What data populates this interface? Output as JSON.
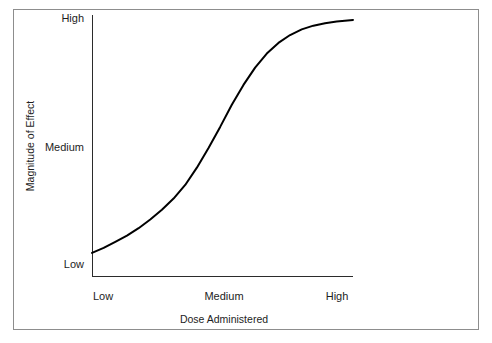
{
  "chart_data": {
    "type": "line",
    "title": "",
    "subtitle": "",
    "xlabel": "Dose Administered",
    "ylabel": "Magnitude of Effect",
    "x_tick_labels": [
      "Low",
      "Medium",
      "High"
    ],
    "y_tick_labels": [
      "Low",
      "Medium",
      "High"
    ],
    "x_tick_positions": [
      0,
      0.5,
      1
    ],
    "y_tick_positions": [
      0,
      0.5,
      1
    ],
    "xlim": [
      0,
      1.12
    ],
    "ylim": [
      0,
      1
    ],
    "grid": false,
    "legend": null,
    "annotations": [],
    "series": [
      {
        "name": "Dose-response",
        "description": "Sigmoid (S-shaped) dose-response curve rising from Low effect at Low dose to High effect at High dose, with steepest slope near the Medium dose.",
        "line_color": "#000000",
        "line_width": 2,
        "x": [
          0.0,
          0.05,
          0.1,
          0.15,
          0.2,
          0.25,
          0.3,
          0.35,
          0.4,
          0.45,
          0.5,
          0.55,
          0.6,
          0.65,
          0.7,
          0.75,
          0.8,
          0.85,
          0.9,
          0.95,
          1.0,
          1.05,
          1.12
        ],
        "y": [
          0.045,
          0.065,
          0.09,
          0.115,
          0.145,
          0.18,
          0.22,
          0.265,
          0.32,
          0.39,
          0.47,
          0.555,
          0.645,
          0.725,
          0.795,
          0.852,
          0.895,
          0.927,
          0.95,
          0.965,
          0.975,
          0.982,
          0.988
        ]
      }
    ]
  },
  "axes": {
    "y_ticks": {
      "high": "High",
      "medium": "Medium",
      "low": "Low"
    },
    "x_ticks": {
      "low": "Low",
      "medium": "Medium",
      "high": "High"
    },
    "x_axis_title": "Dose Administered",
    "y_axis_title": "Magnitude of Effect"
  },
  "style": {
    "background": "#ffffff",
    "frame_border": "#8d8d8d",
    "axis_color": "#2b2b2b",
    "curve_color": "#000000",
    "text_color": "#1d1d1d"
  }
}
